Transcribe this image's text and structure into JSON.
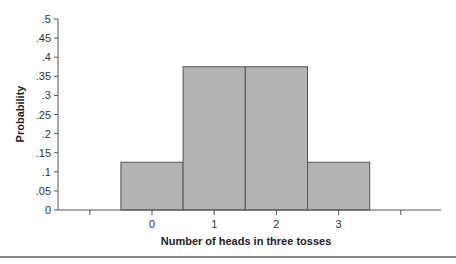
{
  "chart_data": {
    "type": "bar",
    "title": "",
    "xlabel": "Number of heads in three tosses",
    "ylabel": "Probability",
    "categories": [
      "0",
      "1",
      "2",
      "3"
    ],
    "values": [
      0.125,
      0.375,
      0.375,
      0.125
    ],
    "ylim": [
      0,
      0.5
    ],
    "xlim": [
      -1,
      4
    ],
    "yticks": [
      0,
      0.05,
      0.1,
      0.15,
      0.2,
      0.25,
      0.3,
      0.35,
      0.4,
      0.45,
      0.5
    ],
    "ytick_labels": [
      "0",
      ".05",
      ".1",
      ".15",
      ".2",
      ".25",
      ".3",
      ".35",
      ".4",
      ".45",
      ".5"
    ],
    "xticks": [
      -1,
      0,
      1,
      2,
      3,
      4
    ],
    "xtick_labels": [
      "",
      "0",
      "1",
      "2",
      "3",
      ""
    ],
    "grid": false,
    "legend": null,
    "bar_color": "#b3b3b3",
    "bar_edge_color": "#555555"
  }
}
